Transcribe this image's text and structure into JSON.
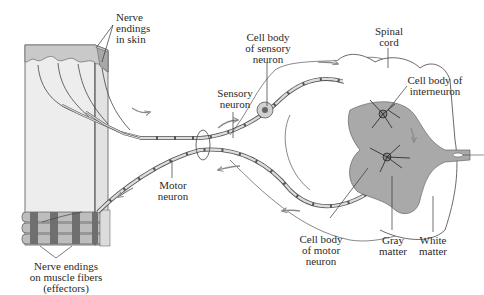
{
  "diagram": {
    "type": "reflex-arc",
    "colors": {
      "line": "#3a3a3a",
      "skin_block": "#ebebeb",
      "epidermis": "#c8c8c8",
      "gray_matter": "#a9a9a9",
      "myelin": "#d6d6d6",
      "arrow": "#8a8a8a",
      "muscle_dark": "#6f6f6f"
    },
    "labels": {
      "nerve_endings_skin": "Nerve\nendings\nin skin",
      "cell_body_sensory": "Cell body\nof sensory\nneuron",
      "spinal_cord": "Spinal\ncord",
      "cell_body_interneuron": "Cell body of\ninterneuron",
      "sensory_neuron": "Sensory\nneuron",
      "motor_neuron": "Motor\nneuron",
      "cell_body_motor": "Cell body\nof motor\nneuron",
      "gray_matter": "Gray\nmatter",
      "white_matter": "White\nmatter",
      "nerve_endings_muscle": "Nerve endings\non muscle fibers\n(effectors)"
    },
    "flow_arrows": [
      {
        "name": "sensory-inbound-arrow",
        "direction": "right"
      },
      {
        "name": "sensory-root-arrow",
        "direction": "right"
      },
      {
        "name": "dorsal-arrow",
        "direction": "right"
      },
      {
        "name": "motor-outbound-arrow",
        "direction": "left"
      },
      {
        "name": "motor-root-arrow",
        "direction": "left"
      },
      {
        "name": "muscle-arrow",
        "direction": "left"
      }
    ]
  }
}
